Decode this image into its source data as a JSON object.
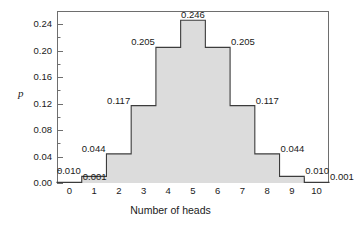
{
  "chart_data": {
    "type": "bar",
    "title": "",
    "xlabel": "Number of heads",
    "ylabel": "p",
    "categories": [
      "0",
      "1",
      "2",
      "3",
      "4",
      "5",
      "6",
      "7",
      "8",
      "9",
      "10"
    ],
    "values": [
      0.001,
      0.01,
      0.044,
      0.117,
      0.205,
      0.246,
      0.205,
      0.117,
      0.044,
      0.01,
      0.001
    ],
    "value_labels": [
      "0.001",
      "0.010",
      "0.044",
      "0.117",
      "0.205",
      "0.246",
      "0.205",
      "0.117",
      "0.044",
      "0.010",
      "0.001"
    ],
    "ylim": [
      0.0,
      0.26
    ],
    "xlim": [
      -0.5,
      10.5
    ],
    "ytick_values": [
      0.0,
      0.04,
      0.08,
      0.12,
      0.16,
      0.2,
      0.24
    ],
    "ytick_labels": [
      "0.00",
      "0.04",
      "0.08",
      "0.12",
      "0.16",
      "0.20",
      "0.24"
    ],
    "yminor_tick_values": [
      0.02,
      0.06,
      0.1,
      0.14,
      0.18,
      0.22
    ],
    "xtick_boundaries": [
      -0.5,
      0.5,
      1.5,
      2.5,
      3.5,
      4.5,
      5.5,
      6.5,
      7.5,
      8.5,
      9.5,
      10.5
    ],
    "grid": false,
    "legend": false,
    "bar_style": "contiguous-step",
    "label_alignment": [
      "left",
      "right",
      "right",
      "right",
      "right",
      "center",
      "left",
      "left",
      "left",
      "left",
      "left"
    ]
  },
  "style": {
    "bar_fill": "#dcdcdc",
    "bar_stroke": "#3c3c3c",
    "axis_color": "#6e6e6e",
    "text_color": "#1a1a1a",
    "background": "#ffffff"
  }
}
